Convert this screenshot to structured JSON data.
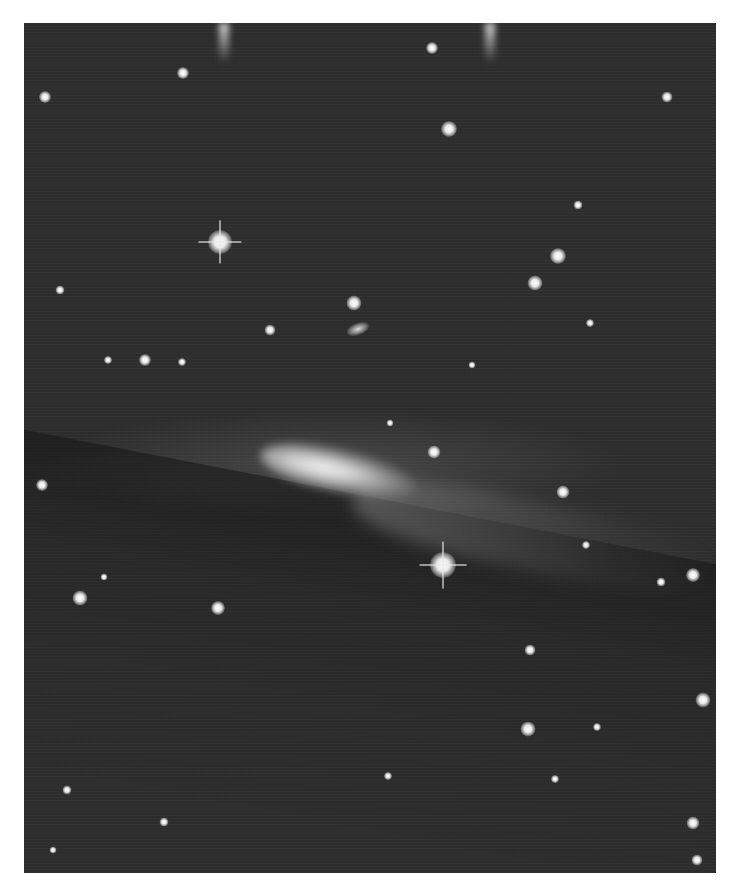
{
  "image": {
    "subject": "comet against star field",
    "style": "grayscale astronomical photograph",
    "colors": {
      "background": "#2e2e2e",
      "border": "#ffffff",
      "stars": "#f0f0f0"
    }
  },
  "stars": [
    {
      "x": 45,
      "y": 97,
      "r": 12
    },
    {
      "x": 183,
      "y": 73,
      "r": 12
    },
    {
      "x": 432,
      "y": 48,
      "r": 12
    },
    {
      "x": 449,
      "y": 129,
      "r": 16
    },
    {
      "x": 667,
      "y": 97,
      "r": 11
    },
    {
      "x": 220,
      "y": 242,
      "r": 24,
      "spike": true
    },
    {
      "x": 558,
      "y": 256,
      "r": 16
    },
    {
      "x": 535,
      "y": 283,
      "r": 15
    },
    {
      "x": 578,
      "y": 205,
      "r": 9
    },
    {
      "x": 354,
      "y": 303,
      "r": 15
    },
    {
      "x": 270,
      "y": 330,
      "r": 11
    },
    {
      "x": 60,
      "y": 290,
      "r": 9
    },
    {
      "x": 145,
      "y": 360,
      "r": 12
    },
    {
      "x": 108,
      "y": 360,
      "r": 8
    },
    {
      "x": 182,
      "y": 362,
      "r": 8
    },
    {
      "x": 590,
      "y": 323,
      "r": 8
    },
    {
      "x": 472,
      "y": 365,
      "r": 7
    },
    {
      "x": 434,
      "y": 452,
      "r": 13
    },
    {
      "x": 390,
      "y": 423,
      "r": 7
    },
    {
      "x": 42,
      "y": 485,
      "r": 12
    },
    {
      "x": 563,
      "y": 492,
      "r": 13
    },
    {
      "x": 586,
      "y": 545,
      "r": 8
    },
    {
      "x": 443,
      "y": 565,
      "r": 26,
      "spike": true
    },
    {
      "x": 80,
      "y": 598,
      "r": 15
    },
    {
      "x": 218,
      "y": 608,
      "r": 14
    },
    {
      "x": 104,
      "y": 577,
      "r": 7
    },
    {
      "x": 693,
      "y": 575,
      "r": 14
    },
    {
      "x": 661,
      "y": 582,
      "r": 9
    },
    {
      "x": 530,
      "y": 650,
      "r": 11
    },
    {
      "x": 703,
      "y": 700,
      "r": 15
    },
    {
      "x": 528,
      "y": 729,
      "r": 15
    },
    {
      "x": 597,
      "y": 727,
      "r": 8
    },
    {
      "x": 388,
      "y": 776,
      "r": 8
    },
    {
      "x": 555,
      "y": 779,
      "r": 8
    },
    {
      "x": 67,
      "y": 790,
      "r": 9
    },
    {
      "x": 164,
      "y": 822,
      "r": 9
    },
    {
      "x": 693,
      "y": 823,
      "r": 13
    },
    {
      "x": 53,
      "y": 850,
      "r": 7
    },
    {
      "x": 697,
      "y": 860,
      "r": 11
    }
  ],
  "galaxies": [
    {
      "x": 358,
      "y": 329,
      "w": 24,
      "h": 12
    }
  ],
  "streaks": [
    {
      "x": 224,
      "y": 23
    },
    {
      "x": 490,
      "y": 23
    }
  ]
}
